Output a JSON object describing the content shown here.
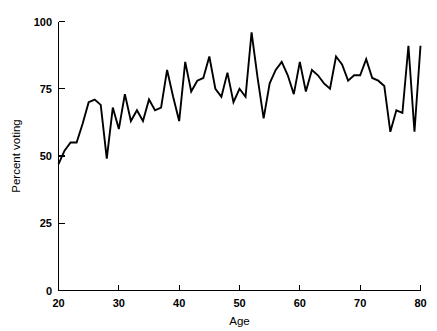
{
  "chart_data": {
    "type": "line",
    "title": "",
    "subtitle": "",
    "xlabel": "Age",
    "ylabel": "Percent voting",
    "xlim": [
      20,
      80
    ],
    "ylim": [
      0,
      100
    ],
    "xticks": [
      20,
      30,
      40,
      50,
      60,
      70,
      80
    ],
    "xtick_labels": [
      "20",
      "30",
      "40",
      "50",
      "60",
      "70",
      "80"
    ],
    "yticks": [
      0,
      25,
      50,
      75,
      100
    ],
    "ytick_labels": [
      "0",
      "25",
      "50",
      "75",
      "100"
    ],
    "grid": false,
    "legend": false,
    "legend_position": "none",
    "series": [
      {
        "name": "Percent voting by age",
        "x": [
          20,
          21,
          22,
          23,
          24,
          25,
          26,
          27,
          28,
          29,
          30,
          31,
          32,
          33,
          34,
          35,
          36,
          37,
          38,
          39,
          40,
          41,
          42,
          43,
          44,
          45,
          46,
          47,
          48,
          49,
          50,
          51,
          52,
          53,
          54,
          55,
          56,
          57,
          58,
          59,
          60,
          61,
          62,
          63,
          64,
          65,
          66,
          67,
          68,
          69,
          70,
          71,
          72,
          73,
          74,
          75,
          76,
          77,
          78,
          79,
          80
        ],
        "values": [
          47,
          52,
          55,
          55,
          62,
          70,
          71,
          69,
          49,
          68,
          60,
          73,
          63,
          67,
          63,
          71,
          67,
          68,
          82,
          72,
          63,
          85,
          74,
          78,
          79,
          87,
          75,
          72,
          81,
          70,
          75,
          72,
          96,
          79,
          64,
          77,
          82,
          85,
          80,
          73,
          85,
          74,
          82,
          80,
          77,
          75,
          87,
          84,
          78,
          80,
          80,
          86,
          79,
          78,
          76,
          59,
          67,
          66,
          91,
          59,
          91
        ]
      }
    ],
    "annotations": []
  },
  "axes": {
    "x_axis_label": "Age",
    "y_axis_label": "Percent voting"
  },
  "colors": {
    "line": "#000000",
    "axis": "#000000",
    "background": "#ffffff"
  }
}
